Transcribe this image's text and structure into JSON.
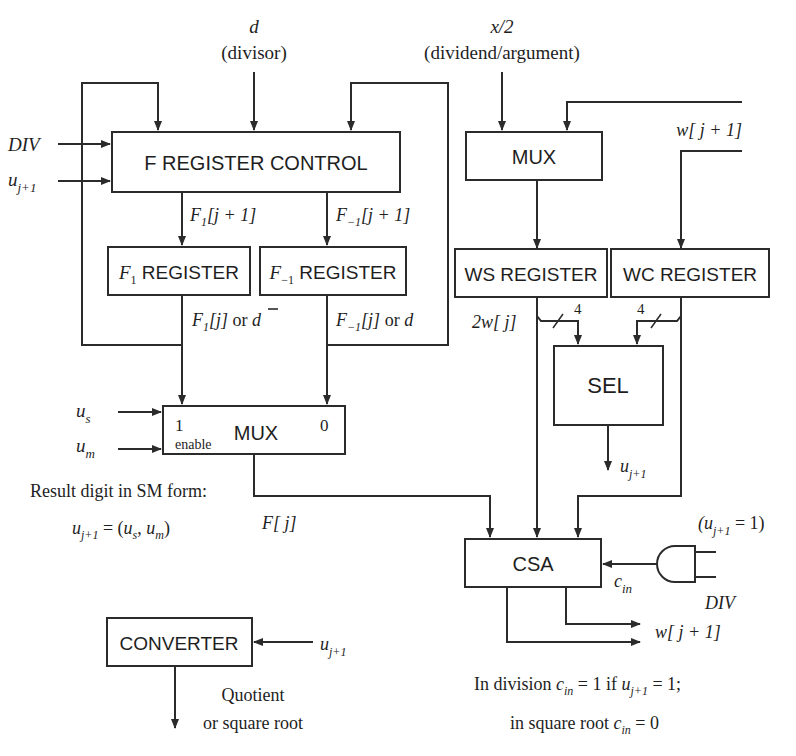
{
  "diagram": {
    "type": "block-diagram",
    "inputs": {
      "divisor": {
        "symbol": "d",
        "label": "(divisor)"
      },
      "dividend": {
        "symbol": "x/2",
        "label": "(dividend/argument)"
      },
      "div_signal": "DIV",
      "u_next": {
        "base": "u",
        "sub": "j+1"
      },
      "u_s": {
        "base": "u",
        "sub": "s"
      },
      "u_m": {
        "base": "u",
        "sub": "m"
      }
    },
    "blocks": {
      "f_register_control": "F REGISTER CONTROL",
      "f1_register": {
        "sym": "F",
        "sub": "1",
        "label": " REGISTER"
      },
      "fm1_register": {
        "sym": "F",
        "sub": "−1",
        "label": " REGISTER"
      },
      "mux_left": {
        "label": "MUX",
        "in1": "1",
        "in0": "0",
        "enable": "enable"
      },
      "mux_right": "MUX",
      "ws_register": "WS REGISTER",
      "wc_register": "WC REGISTER",
      "sel": "SEL",
      "csa": "CSA",
      "converter": "CONVERTER"
    },
    "signals": {
      "f1_next": {
        "sym": "F",
        "sub": "1",
        "rest": "[j + 1]"
      },
      "fm1_next": {
        "sym": "F",
        "sub": "−1",
        "rest": "[j + 1]"
      },
      "f1_out": {
        "sym": "F",
        "sub": "1",
        "rest": "[j]",
        "or": " or ",
        "alt": "d"
      },
      "fm1_out": {
        "sym": "F",
        "sub": "−1",
        "rest": "[j]",
        "or": " or ",
        "alt": "d"
      },
      "w_feedback": "w[ j + 1]",
      "two_w": "2w[ j]",
      "bus_width_ws": "4",
      "bus_width_wc": "4",
      "f_j": "F[ j]",
      "c_in": {
        "base": "c",
        "sub": "in"
      },
      "and_top": {
        "open": "(u",
        "sub": "j+1",
        "close": " = 1)"
      },
      "and_bottom": "DIV",
      "w_out": "w[ j + 1]",
      "quotient": "Quotient",
      "quotient2": "or square root"
    },
    "annotations": {
      "result_digit": "Result digit in SM form:",
      "formula": {
        "lhs": "u",
        "lhs_sub": "j+1",
        "eq": " = (",
        "a": "u",
        "a_sub": "s",
        "comma": ", ",
        "b": "u",
        "b_sub": "m",
        "close": ")"
      },
      "division_note": {
        "pre": "In division ",
        "c": "c",
        "c_sub": "in",
        "mid": " = 1 if  ",
        "u": "u",
        "u_sub": "j+1",
        "post": " = 1;"
      },
      "sqrt_note": {
        "pre": "in square root ",
        "c": "c",
        "c_sub": "in",
        "post": " = 0"
      }
    }
  }
}
